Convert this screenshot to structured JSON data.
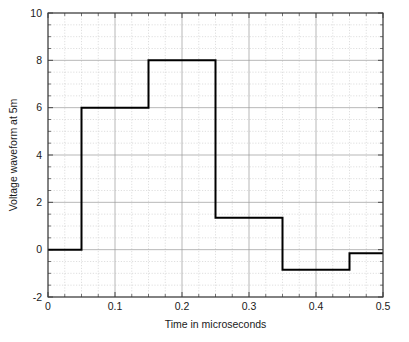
{
  "chart_data": {
    "type": "line",
    "title": "",
    "xlabel": "Time in microseconds",
    "ylabel": "Voltage waveform at 5m",
    "xlim": [
      0,
      0.5
    ],
    "ylim": [
      -2,
      10
    ],
    "xticks": [
      0,
      0.1,
      0.2,
      0.3,
      0.4,
      0.5
    ],
    "xtick_labels": [
      "0",
      "0.1",
      "0.2",
      "0.3",
      "0.4",
      "0.5"
    ],
    "yticks": [
      -2,
      0,
      2,
      4,
      6,
      8,
      10
    ],
    "ytick_labels": [
      "-2",
      "0",
      "2",
      "4",
      "6",
      "8",
      "10"
    ],
    "x_minor_step": 0.025,
    "y_minor_step": 0.5,
    "grid": true,
    "grid_major_color": "#9a9a9a",
    "grid_minor_color": "#c9c9c9",
    "legend": null,
    "line_color": "#000000",
    "line_width": 2.0,
    "drawstyle": "steps-post",
    "series": [
      {
        "name": "Voltage waveform at 5m",
        "x": [
          0,
          0.05,
          0.15,
          0.25,
          0.35,
          0.45,
          0.5
        ],
        "values": [
          0,
          6,
          8,
          1.35,
          -0.85,
          -0.15,
          -0.15
        ]
      }
    ],
    "steps": [
      {
        "x_start": 0,
        "x_end": 0.05,
        "level": 0
      },
      {
        "x_start": 0.05,
        "x_end": 0.15,
        "level": 6
      },
      {
        "x_start": 0.15,
        "x_end": 0.25,
        "level": 8
      },
      {
        "x_start": 0.25,
        "x_end": 0.35,
        "level": 1.35
      },
      {
        "x_start": 0.35,
        "x_end": 0.45,
        "level": -0.85
      },
      {
        "x_start": 0.45,
        "x_end": 0.5,
        "level": -0.15
      }
    ]
  },
  "axes": {
    "frame_color": "#3a3a3a",
    "xlabel": "Time in microseconds",
    "ylabel": "Voltage waveform at 5m"
  }
}
